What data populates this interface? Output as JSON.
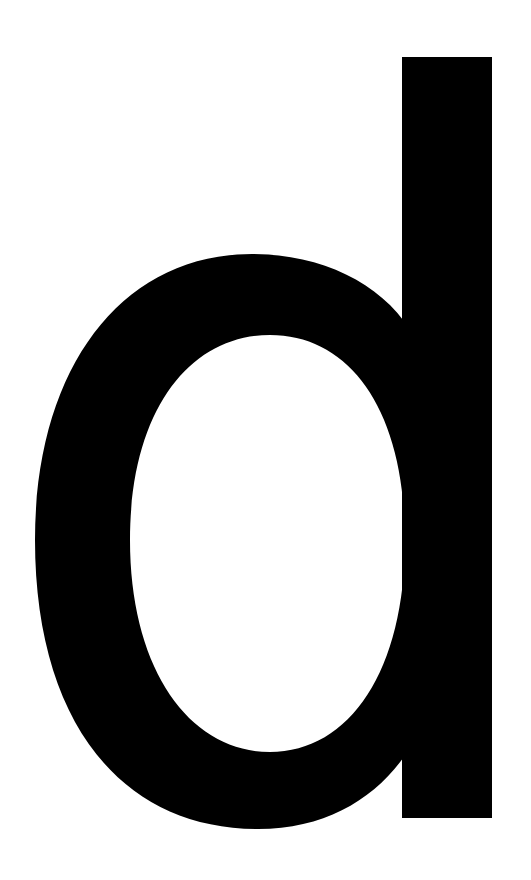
{
  "glyph": {
    "character": "d",
    "color": "#000000",
    "background": "#ffffff"
  }
}
